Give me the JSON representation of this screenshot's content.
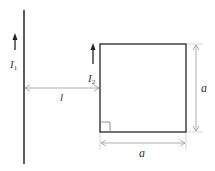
{
  "diagram": {
    "title": "",
    "wire": {
      "current_label": "I",
      "current_sub": "1"
    },
    "loop": {
      "current_label": "I",
      "current_sub": "2"
    },
    "distance_label": "l",
    "side_vertical_label": "a",
    "side_horizontal_label": "a"
  }
}
